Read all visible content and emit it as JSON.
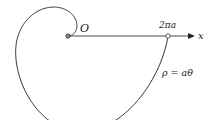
{
  "diagram": {
    "origin_label": "O",
    "point_label": "2πa",
    "axis_label": "x",
    "equation_label": "ρ = aθ",
    "stroke_color": "#333333",
    "point_fill": "#888888"
  },
  "geometry": {
    "origin": [
      68,
      36
    ],
    "point_2pi_a": [
      168,
      36
    ],
    "axis_end": [
      195,
      36
    ],
    "spiral_theta_max": 6.2832,
    "scale_x": 1.0,
    "scale_y": 1.25
  }
}
